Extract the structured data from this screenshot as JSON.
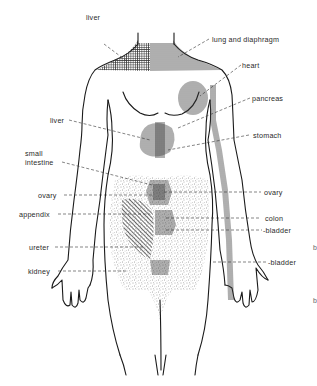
{
  "diagram": {
    "colors": {
      "ink": "#1a1a1a",
      "background": "#ffffff",
      "hatch": "#333333",
      "stipple": "#444444"
    },
    "labels": {
      "liver_top": "liver",
      "lung_diaphragm": "lung and diaphragm",
      "heart": "heart",
      "pancreas": "pancreas",
      "liver_mid": "liver",
      "stomach": "stomach",
      "small_intestine_1": "small",
      "small_intestine_2": "intestine",
      "ovary_left": "ovary",
      "ovary_right": "ovary",
      "appendix": "appendix",
      "colon": "colon",
      "bladder_1": "-bladder",
      "ureter": "ureter",
      "bladder_2": "-bladder",
      "kidney": "kidney"
    },
    "stray_marks": [
      "b",
      "b"
    ]
  }
}
